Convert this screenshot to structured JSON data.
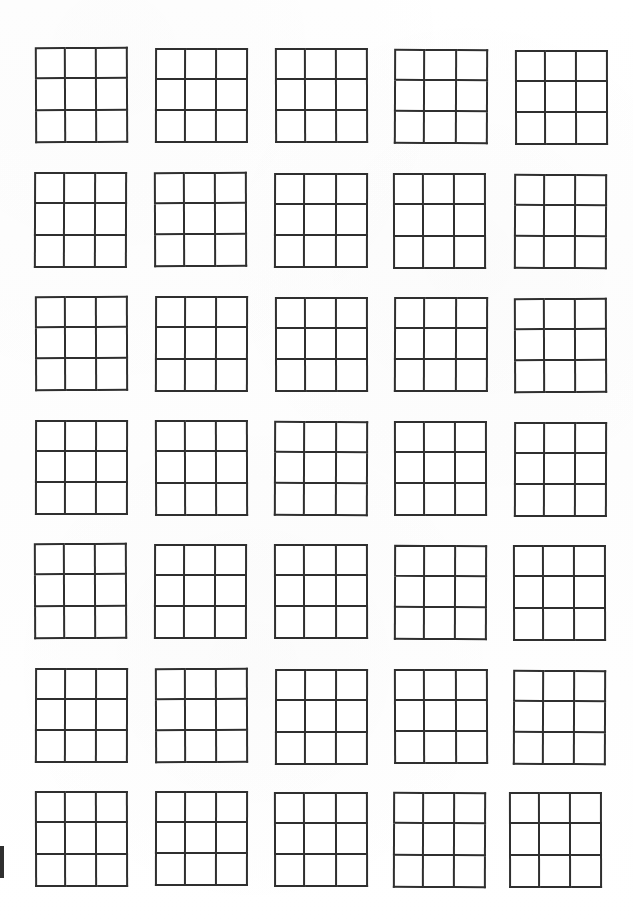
{
  "document": {
    "title": "Blank 3x3 Grid Worksheet",
    "page_width": 633,
    "page_height": 924,
    "background_color": "#ffffff",
    "ink_color": "#2f2f2f",
    "line_width_px": 2,
    "scan_artifact_color": "#1d1d1d",
    "description": "Scanned worksheet page containing a 7 by 5 arrangement of empty three-by-three square grids, all cells blank."
  },
  "layout": {
    "rows": 7,
    "columns": 5,
    "total_grids": 35,
    "cells_per_grid": 9,
    "grid_rows": 3,
    "grid_columns": 3,
    "row_pitch_px": 124,
    "column_pitch_px": 119,
    "first_grid_left_px": 35,
    "first_grid_top_px": 47,
    "nominal_grid_width_px": 93,
    "nominal_grid_height_px": 96
  },
  "artifact": {
    "name": "left-edge-scan-mark",
    "left": 0,
    "top": 846,
    "width": 4,
    "height": 32
  },
  "grids": [
    {
      "index": 1,
      "row": 1,
      "col": 1,
      "left": 35,
      "top": 47,
      "width": 93,
      "height": 96,
      "rotation": -0.25
    },
    {
      "index": 2,
      "row": 1,
      "col": 2,
      "left": 155,
      "top": 48,
      "width": 93,
      "height": 95,
      "rotation": 0.1
    },
    {
      "index": 3,
      "row": 1,
      "col": 3,
      "left": 275,
      "top": 48,
      "width": 93,
      "height": 95,
      "rotation": -0.15
    },
    {
      "index": 4,
      "row": 1,
      "col": 4,
      "left": 394,
      "top": 49,
      "width": 94,
      "height": 95,
      "rotation": 0.2
    },
    {
      "index": 5,
      "row": 1,
      "col": 5,
      "left": 515,
      "top": 50,
      "width": 93,
      "height": 95,
      "rotation": -0.1
    },
    {
      "index": 6,
      "row": 2,
      "col": 1,
      "left": 34,
      "top": 172,
      "width": 93,
      "height": 96,
      "rotation": 0.15
    },
    {
      "index": 7,
      "row": 2,
      "col": 2,
      "left": 154,
      "top": 172,
      "width": 93,
      "height": 95,
      "rotation": -0.2
    },
    {
      "index": 8,
      "row": 2,
      "col": 3,
      "left": 274,
      "top": 173,
      "width": 94,
      "height": 95,
      "rotation": 0.1
    },
    {
      "index": 9,
      "row": 2,
      "col": 4,
      "left": 393,
      "top": 173,
      "width": 93,
      "height": 96,
      "rotation": -0.12
    },
    {
      "index": 10,
      "row": 2,
      "col": 5,
      "left": 514,
      "top": 174,
      "width": 93,
      "height": 95,
      "rotation": 0.18
    },
    {
      "index": 11,
      "row": 3,
      "col": 1,
      "left": 35,
      "top": 296,
      "width": 93,
      "height": 95,
      "rotation": -0.18
    },
    {
      "index": 12,
      "row": 3,
      "col": 2,
      "left": 155,
      "top": 296,
      "width": 93,
      "height": 96,
      "rotation": 0.12
    },
    {
      "index": 13,
      "row": 3,
      "col": 3,
      "left": 275,
      "top": 297,
      "width": 93,
      "height": 95,
      "rotation": -0.1
    },
    {
      "index": 14,
      "row": 3,
      "col": 4,
      "left": 394,
      "top": 297,
      "width": 94,
      "height": 95,
      "rotation": 0.15
    },
    {
      "index": 15,
      "row": 3,
      "col": 5,
      "left": 514,
      "top": 298,
      "width": 93,
      "height": 95,
      "rotation": -0.2
    },
    {
      "index": 16,
      "row": 4,
      "col": 1,
      "left": 35,
      "top": 420,
      "width": 93,
      "height": 95,
      "rotation": 0.1
    },
    {
      "index": 17,
      "row": 4,
      "col": 2,
      "left": 155,
      "top": 420,
      "width": 93,
      "height": 96,
      "rotation": -0.15
    },
    {
      "index": 18,
      "row": 4,
      "col": 3,
      "left": 274,
      "top": 421,
      "width": 94,
      "height": 95,
      "rotation": 0.2
    },
    {
      "index": 19,
      "row": 4,
      "col": 4,
      "left": 394,
      "top": 421,
      "width": 93,
      "height": 95,
      "rotation": -0.1
    },
    {
      "index": 20,
      "row": 4,
      "col": 5,
      "left": 514,
      "top": 422,
      "width": 93,
      "height": 95,
      "rotation": 0.14
    },
    {
      "index": 21,
      "row": 5,
      "col": 1,
      "left": 34,
      "top": 543,
      "width": 93,
      "height": 96,
      "rotation": -0.22
    },
    {
      "index": 22,
      "row": 5,
      "col": 2,
      "left": 154,
      "top": 544,
      "width": 93,
      "height": 95,
      "rotation": 0.1
    },
    {
      "index": 23,
      "row": 5,
      "col": 3,
      "left": 274,
      "top": 544,
      "width": 94,
      "height": 95,
      "rotation": -0.12
    },
    {
      "index": 24,
      "row": 5,
      "col": 4,
      "left": 394,
      "top": 545,
      "width": 93,
      "height": 95,
      "rotation": 0.16
    },
    {
      "index": 25,
      "row": 5,
      "col": 5,
      "left": 513,
      "top": 545,
      "width": 93,
      "height": 96,
      "rotation": -0.1
    },
    {
      "index": 26,
      "row": 6,
      "col": 1,
      "left": 35,
      "top": 668,
      "width": 93,
      "height": 95,
      "rotation": 0.12
    },
    {
      "index": 27,
      "row": 6,
      "col": 2,
      "left": 155,
      "top": 668,
      "width": 93,
      "height": 95,
      "rotation": -0.18
    },
    {
      "index": 28,
      "row": 6,
      "col": 3,
      "left": 275,
      "top": 669,
      "width": 93,
      "height": 96,
      "rotation": 0.1
    },
    {
      "index": 29,
      "row": 6,
      "col": 4,
      "left": 394,
      "top": 669,
      "width": 94,
      "height": 95,
      "rotation": -0.14
    },
    {
      "index": 30,
      "row": 6,
      "col": 5,
      "left": 513,
      "top": 670,
      "width": 93,
      "height": 95,
      "rotation": 0.2
    },
    {
      "index": 31,
      "row": 7,
      "col": 1,
      "left": 35,
      "top": 791,
      "width": 93,
      "height": 96,
      "rotation": -0.15
    },
    {
      "index": 32,
      "row": 7,
      "col": 2,
      "left": 155,
      "top": 791,
      "width": 93,
      "height": 95,
      "rotation": 0.1
    },
    {
      "index": 33,
      "row": 7,
      "col": 3,
      "left": 274,
      "top": 792,
      "width": 94,
      "height": 95,
      "rotation": -0.12
    },
    {
      "index": 34,
      "row": 7,
      "col": 4,
      "left": 393,
      "top": 792,
      "width": 93,
      "height": 96,
      "rotation": 0.18
    },
    {
      "index": 35,
      "row": 7,
      "col": 5,
      "left": 509,
      "top": 792,
      "width": 93,
      "height": 96,
      "rotation": -0.1
    }
  ]
}
